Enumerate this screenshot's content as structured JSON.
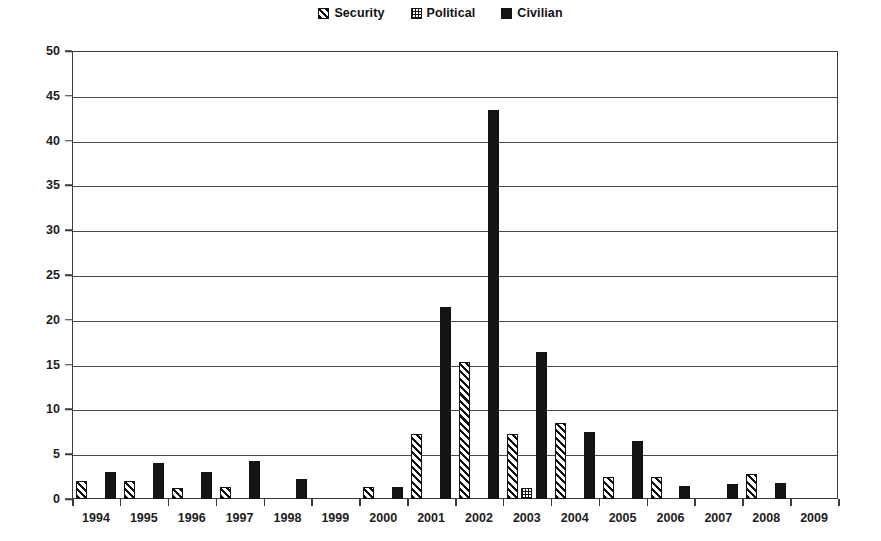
{
  "chart_data": {
    "type": "bar",
    "title": "",
    "subtitle": "",
    "xlabel": "",
    "ylabel": "",
    "ylim": [
      0,
      50
    ],
    "ytick_step": 5,
    "yticks": [
      0,
      5,
      10,
      15,
      20,
      25,
      30,
      35,
      40,
      45,
      50
    ],
    "grid": true,
    "grid_axis": "y",
    "legend_position": "top-center",
    "categories": [
      "1994",
      "1995",
      "1996",
      "1997",
      "1998",
      "1999",
      "2000",
      "2001",
      "2002",
      "2003",
      "2004",
      "2005",
      "2006",
      "2007",
      "2008",
      "2009"
    ],
    "series": [
      {
        "name": "Security",
        "pattern": "diagonal-hatch",
        "color": "#111111",
        "values": [
          2.0,
          2.0,
          1.2,
          1.3,
          0.0,
          0.0,
          1.3,
          7.3,
          15.3,
          7.3,
          8.5,
          2.5,
          2.5,
          0.0,
          2.8,
          0.0
        ]
      },
      {
        "name": "Political",
        "pattern": "dotted-checker",
        "color": "#111111",
        "values": [
          0.0,
          0.0,
          0.0,
          0.0,
          0.0,
          0.0,
          0.0,
          0.0,
          0.0,
          1.2,
          0.0,
          0.0,
          0.0,
          0.0,
          0.0,
          0.0
        ]
      },
      {
        "name": "Civilian",
        "pattern": "solid",
        "color": "#141414",
        "values": [
          3.0,
          4.0,
          3.0,
          4.2,
          2.2,
          0.0,
          1.3,
          21.4,
          43.4,
          16.4,
          7.5,
          6.5,
          1.5,
          1.7,
          1.8,
          0.0
        ]
      }
    ]
  },
  "legend": {
    "items": [
      {
        "label": "Security",
        "icon": "hatch-swatch"
      },
      {
        "label": "Political",
        "icon": "dotted-swatch"
      },
      {
        "label": "Civilian",
        "icon": "solid-swatch"
      }
    ]
  },
  "colors": {
    "ink": "#111111",
    "axis": "#3a3a3a",
    "grid": "#4a4a4a",
    "background": "#ffffff"
  }
}
